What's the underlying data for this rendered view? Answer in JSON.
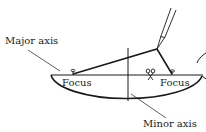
{
  "diagram": {
    "labels": {
      "major_axis": "Major axis",
      "minor_axis": "Minor axis",
      "focus_left": "Focus",
      "focus_right": "Focus"
    },
    "colors": {
      "stroke": "#1a1a1a",
      "background": "#ffffff"
    }
  }
}
